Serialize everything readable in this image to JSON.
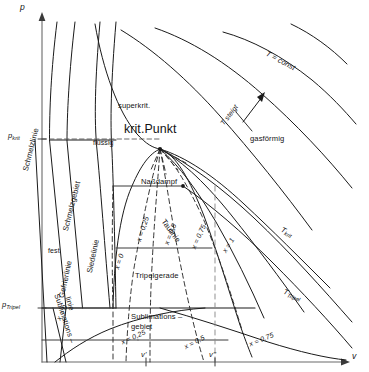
{
  "figure": {
    "kind": "p-v phase diagram (Zustandsdiagramm)",
    "language": "de"
  },
  "axes": {
    "y_axis_label": "p",
    "x_axis_label": "v",
    "y_ticks": [
      {
        "id": "p_krit",
        "text": "p",
        "sub": "krit",
        "y_px": 139
      },
      {
        "id": "p_tripel",
        "text": "p",
        "sub": "Tripel",
        "y_px": 308
      }
    ],
    "x_ticks": [
      {
        "id": "v_prime",
        "text": "v'",
        "x_px": 146
      },
      {
        "id": "v_2prime",
        "text": "v''",
        "x_px": 215
      }
    ]
  },
  "regions": {
    "superkrit": "superkrit.",
    "gasfoermig": "gasförmig",
    "fluessig": "flüssig",
    "fest": "fest",
    "nassdampf": "Naßdampf",
    "schmelzgebiet": "Schmelzgebiet",
    "sublimations_gebiet_l1": "Sublimations –",
    "sublimations_gebiet_l2": "gebiet"
  },
  "curves": {
    "krit_punkt": "krit.Punkt",
    "schmelzlinie": "Schmelzlinie",
    "gefrierlinie": "Gefrierlinie",
    "siedelinie": "Siedelinie",
    "taulinie": "Taulinie",
    "tripelgerade": "Tripelgerade",
    "sublimationslinie_l1": "Sublimations –",
    "sublimationslinie_l2": "linie"
  },
  "isotherms": {
    "t_const": "T = const",
    "t_steigt": "T steigt",
    "t_krit": {
      "text": "T",
      "sub": "krit"
    },
    "t_tripel": {
      "text": "T",
      "sub": "Tripel"
    }
  },
  "quality_labels": {
    "nassdampf": [
      {
        "text": "x = 0",
        "x_px": 113,
        "y_px": 268,
        "rot": -72
      },
      {
        "text": "x = 0,25",
        "x_px": 135,
        "y_px": 240,
        "rot": -71
      },
      {
        "text": "x = 0,5",
        "x_px": 163,
        "y_px": 243,
        "rot": -69
      },
      {
        "text": "x = 0,75",
        "x_px": 190,
        "y_px": 247,
        "rot": -66
      },
      {
        "text": "x = 1",
        "x_px": 221,
        "y_px": 250,
        "rot": -58
      }
    ],
    "sublimation": [
      {
        "text": "x = 0",
        "x_px": 55,
        "y_px": 318,
        "rot": -62
      },
      {
        "text": "x = 0,25",
        "x_px": 120,
        "y_px": 339,
        "rot": -24
      },
      {
        "text": "x = 0,5",
        "x_px": 183,
        "y_px": 344,
        "rot": -28
      },
      {
        "text": "x = 0,75",
        "x_px": 248,
        "y_px": 341,
        "rot": -22
      }
    ]
  },
  "colors": {
    "line": "#1a1a1a",
    "dashed": "#2b2b2b",
    "axis": "#555555",
    "text": "#141414",
    "bg": "#ffffff"
  }
}
